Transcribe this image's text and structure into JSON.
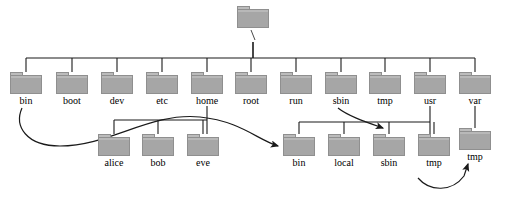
{
  "diagram": {
    "colors": {
      "folder_fill": "#a6a6a6",
      "folder_tab": "#bcbcbc",
      "folder_stroke": "#8f8f8f",
      "line": "#1a1a1a",
      "background": "#ffffff",
      "label": "#000000"
    }
  },
  "root": {
    "label": "/",
    "icon": "folder-icon",
    "x": 237,
    "y": 6
  },
  "level1": {
    "bus_y": 58,
    "nodes": [
      {
        "label": "bin",
        "x": 10,
        "y": 72,
        "cx": 26,
        "icon": "folder-icon"
      },
      {
        "label": "boot",
        "x": 56,
        "y": 72,
        "cx": 72,
        "icon": "folder-icon"
      },
      {
        "label": "dev",
        "x": 101,
        "y": 72,
        "cx": 117,
        "icon": "folder-icon"
      },
      {
        "label": "etc",
        "x": 146,
        "y": 72,
        "cx": 162,
        "icon": "folder-icon"
      },
      {
        "label": "home",
        "x": 191,
        "y": 72,
        "cx": 207,
        "icon": "folder-icon"
      },
      {
        "label": "root",
        "x": 235,
        "y": 72,
        "cx": 251,
        "icon": "folder-icon"
      },
      {
        "label": "run",
        "x": 280,
        "y": 72,
        "cx": 296,
        "icon": "folder-icon"
      },
      {
        "label": "sbin",
        "x": 325,
        "y": 72,
        "cx": 341,
        "icon": "folder-icon"
      },
      {
        "label": "tmp",
        "x": 369,
        "y": 72,
        "cx": 385,
        "icon": "folder-icon"
      },
      {
        "label": "usr",
        "x": 414,
        "y": 72,
        "cx": 430,
        "icon": "folder-icon"
      },
      {
        "label": "var",
        "x": 459,
        "y": 72,
        "cx": 475,
        "icon": "folder-icon"
      }
    ]
  },
  "home_children": {
    "parent": "home",
    "bus_y": 120,
    "nodes": [
      {
        "label": "alice",
        "x": 98,
        "y": 134,
        "cx": 114,
        "icon": "folder-icon"
      },
      {
        "label": "bob",
        "x": 142,
        "y": 134,
        "cx": 158,
        "icon": "folder-icon"
      },
      {
        "label": "eve",
        "x": 187,
        "y": 134,
        "cx": 203,
        "icon": "folder-icon"
      }
    ]
  },
  "usr_children": {
    "parent": "usr",
    "bus_y": 122,
    "nodes": [
      {
        "label": "bin",
        "x": 283,
        "y": 134,
        "cx": 299,
        "icon": "folder-icon"
      },
      {
        "label": "local",
        "x": 328,
        "y": 134,
        "cx": 344,
        "icon": "folder-icon"
      },
      {
        "label": "sbin",
        "x": 373,
        "y": 134,
        "cx": 389,
        "icon": "folder-icon"
      },
      {
        "label": "tmp",
        "x": 418,
        "y": 134,
        "cx": 434,
        "icon": "folder-icon"
      }
    ]
  },
  "var_children": {
    "parent": "var",
    "nodes": [
      {
        "label": "tmp",
        "x": 459,
        "y": 128,
        "cx": 475,
        "icon": "folder-icon"
      }
    ]
  },
  "symlinks": [
    {
      "name": "bin-to-usr-bin",
      "from": "bin",
      "to": "usr/bin",
      "arrow": "curved-arrow-icon"
    },
    {
      "name": "sbin-to-usr-sbin",
      "from": "sbin",
      "to": "usr/sbin",
      "arrow": "curved-arrow-icon"
    },
    {
      "name": "usr-tmp-to-var-tmp",
      "from": "usr/tmp",
      "to": "var/tmp",
      "arrow": "curved-arrow-icon"
    }
  ]
}
